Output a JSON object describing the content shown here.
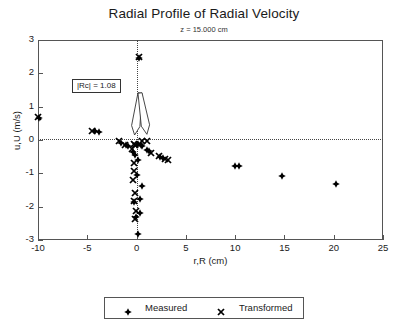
{
  "chart_data": {
    "type": "scatter",
    "title": "Radial Profile of Radial Velocity",
    "subtitle": "z = 15.000 cm",
    "xlabel": "r,R (cm)",
    "ylabel": "u,U (m/s)",
    "xlim": [
      -10,
      25
    ],
    "ylim": [
      -3,
      3
    ],
    "xticks": [
      -10,
      -5,
      0,
      5,
      10,
      15,
      20,
      25
    ],
    "xticklabels": [
      "-10",
      "-5",
      "0",
      "5",
      "10",
      "15",
      "20",
      "25"
    ],
    "yticks": [
      -3,
      -2,
      -1,
      0,
      1,
      2,
      3
    ],
    "yticklabels": [
      "-3",
      "-2",
      "-1",
      "0",
      "1",
      "2",
      "3"
    ],
    "grid": false,
    "zero_lines": {
      "horizontal": 0,
      "vertical": 0,
      "style": "dotted"
    },
    "legend_position": "bottom-center",
    "annotations": [
      {
        "text": "|Rc| = 1.08",
        "x": -5.3,
        "y": 1.42,
        "arrows": [
          {
            "to_x": -0.2,
            "to_y": 0.03
          },
          {
            "to_x": 1.05,
            "to_y": 0.05
          }
        ]
      }
    ],
    "series": [
      {
        "name": "Measured",
        "marker": "filled-plus-diamond",
        "color": "#000000",
        "points": [
          [
            -10.0,
            0.8
          ],
          [
            -4.3,
            0.4
          ],
          [
            -3.9,
            0.38
          ],
          [
            -1.6,
            0.06
          ],
          [
            -1.1,
            -0.02
          ],
          [
            -0.9,
            -0.05
          ],
          [
            -0.4,
            -0.22
          ],
          [
            -0.2,
            -0.3
          ],
          [
            0.35,
            -0.02
          ],
          [
            0.55,
            -0.05
          ],
          [
            1.05,
            -0.16
          ],
          [
            1.25,
            -0.2
          ],
          [
            2.35,
            -0.37
          ],
          [
            2.6,
            -0.4
          ],
          [
            0.2,
            2.6
          ],
          [
            0.1,
            0.02
          ],
          [
            -0.05,
            0.0
          ],
          [
            0.1,
            -0.45
          ],
          [
            0.0,
            -0.9
          ],
          [
            0.55,
            -1.25
          ],
          [
            0.25,
            -1.62
          ],
          [
            -0.35,
            -1.72
          ],
          [
            0.3,
            -2.05
          ],
          [
            -0.1,
            -2.18
          ],
          [
            0.1,
            -2.68
          ],
          [
            9.9,
            -0.63
          ],
          [
            10.3,
            -0.63
          ],
          [
            14.7,
            -0.95
          ],
          [
            20.2,
            -1.18
          ]
        ]
      },
      {
        "name": "Transformed",
        "marker": "cross-x",
        "color": "#000000",
        "points": [
          [
            -10.1,
            0.82
          ],
          [
            -4.6,
            0.42
          ],
          [
            -1.85,
            0.1
          ],
          [
            -1.2,
            0.0
          ],
          [
            -0.55,
            -0.12
          ],
          [
            -0.3,
            0.02
          ],
          [
            0.45,
            0.12
          ],
          [
            1.0,
            0.12
          ],
          [
            1.45,
            -0.26
          ],
          [
            2.2,
            -0.35
          ],
          [
            2.85,
            -0.43
          ],
          [
            3.15,
            -0.46
          ],
          [
            0.15,
            2.62
          ],
          [
            -0.2,
            -0.02
          ],
          [
            -0.35,
            -0.55
          ],
          [
            -0.3,
            -0.78
          ],
          [
            -0.45,
            -1.05
          ],
          [
            -0.25,
            -1.45
          ],
          [
            -0.3,
            -1.68
          ],
          [
            -0.15,
            -1.98
          ],
          [
            -0.2,
            -2.22
          ]
        ]
      }
    ]
  },
  "legend": {
    "entries": [
      {
        "label": "Measured",
        "marker": "filled-plus-diamond"
      },
      {
        "label": "Transformed",
        "marker": "cross-x"
      }
    ]
  }
}
